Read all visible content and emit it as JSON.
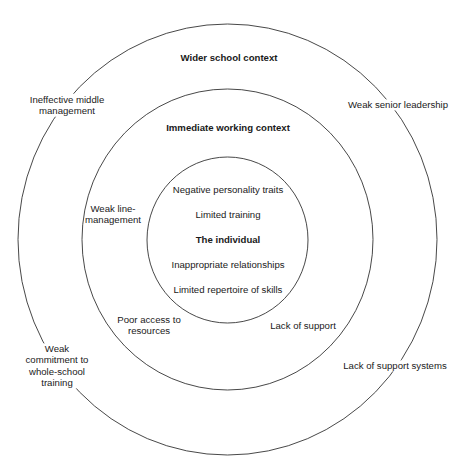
{
  "diagram": {
    "type": "concentric-circles",
    "colors": {
      "stroke": "#333333",
      "text": "#1a1a1a",
      "background": "#ffffff"
    },
    "rings": [
      {
        "id": "outer",
        "title": "Wider school context",
        "factors": [
          {
            "lines": [
              "Ineffective middle",
              "management"
            ]
          },
          {
            "lines": [
              "Weak senior leadership"
            ]
          },
          {
            "lines": [
              "Weak",
              "commitment to",
              "whole-school",
              "training"
            ]
          },
          {
            "lines": [
              "Lack of support systems"
            ]
          }
        ]
      },
      {
        "id": "middle",
        "title": "Immediate working context",
        "factors": [
          {
            "lines": [
              "Weak line-",
              "management"
            ]
          },
          {
            "lines": [
              "Poor access to",
              "resources"
            ]
          },
          {
            "lines": [
              "Lack of support"
            ]
          }
        ]
      },
      {
        "id": "inner",
        "title": "The individual",
        "factors": [
          {
            "lines": [
              "Negative personality traits"
            ]
          },
          {
            "lines": [
              "Limited training"
            ]
          },
          {
            "lines": [
              "Inappropriate relationships"
            ]
          },
          {
            "lines": [
              "Limited repertoire of skills"
            ]
          }
        ]
      }
    ]
  }
}
